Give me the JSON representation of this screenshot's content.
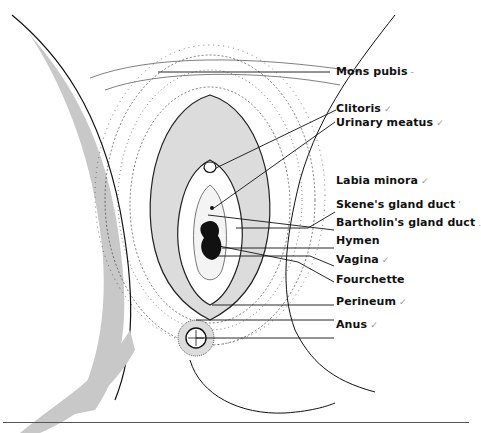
{
  "figure": {
    "type": "anatomical-line-drawing"
  },
  "labels": [
    {
      "text": "Mons pubis",
      "mark": "-"
    },
    {
      "text": "Clitoris",
      "mark": "✓"
    },
    {
      "text": "Urinary meatus",
      "mark": "✓"
    },
    {
      "text": "Labia minora",
      "mark": "✓"
    },
    {
      "text": "Skene's gland duct",
      "mark": "'"
    },
    {
      "text": "Bartholin's gland duct",
      "mark": "."
    },
    {
      "text": "Hymen",
      "mark": ""
    },
    {
      "text": "Vagina",
      "mark": "✓"
    },
    {
      "text": "Fourchette",
      "mark": ""
    },
    {
      "text": "Perineum",
      "mark": "✓"
    },
    {
      "text": "Anus",
      "mark": "✓"
    }
  ],
  "colors": {
    "ink": "#111111",
    "shading": "#c8c8c8",
    "hair": "#2a2a2a"
  }
}
